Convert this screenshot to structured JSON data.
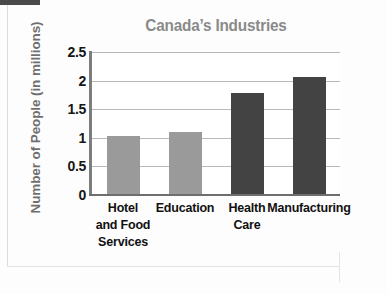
{
  "chart_data": {
    "type": "bar",
    "title": "Canada’s Industries",
    "xlabel": "",
    "ylabel": "Number of People (in millions)",
    "categories": [
      "Hotel and Food Services",
      "Education",
      "Health Care",
      "Manufacturing"
    ],
    "values": [
      1.03,
      1.1,
      1.78,
      2.07
    ],
    "ylim": [
      0,
      2.5
    ],
    "yticks": [
      "2.5",
      "2",
      "1.5",
      "1",
      "0.5",
      "0"
    ],
    "ytick_values": [
      2.5,
      2,
      1.5,
      1,
      0.5,
      0
    ],
    "grid": true,
    "legend": false,
    "bar_colors": [
      "#9a9a9a",
      "#9a9a9a",
      "#434343",
      "#434343"
    ],
    "series": [
      {
        "name": "Number of People (in millions)",
        "values": [
          1.03,
          1.1,
          1.78,
          2.07
        ]
      }
    ]
  },
  "chart": {
    "title": "Canada’s Industries",
    "y_axis_title": "Number of People (in millions)",
    "y_ticks": [
      {
        "label": "2.5",
        "value": 2.5
      },
      {
        "label": "2",
        "value": 2
      },
      {
        "label": "1.5",
        "value": 1.5
      },
      {
        "label": "1",
        "value": 1
      },
      {
        "label": "0.5",
        "value": 0.5
      },
      {
        "label": "0",
        "value": 0
      }
    ],
    "bars": [
      {
        "label_lines": [
          "Hotel",
          "and Food",
          "Services"
        ],
        "label": "Hotel and Food Services",
        "value": 1.03,
        "color": "#9a9a9a"
      },
      {
        "label_lines": [
          "Education"
        ],
        "label": "Education",
        "value": 1.1,
        "color": "#9a9a9a"
      },
      {
        "label_lines": [
          "Health",
          "Care"
        ],
        "label": "Health Care",
        "value": 1.78,
        "color": "#434343"
      },
      {
        "label_lines": [
          "Manufacturing"
        ],
        "label": "Manufacturing",
        "value": 2.07,
        "color": "#434343"
      }
    ],
    "colors": {
      "title": "#8a8a8a",
      "axis_title": "#6f6f6f",
      "gridline": "#b9b9b9",
      "axis_line": "#7d7d7d",
      "tick_text": "#161616",
      "plot_background": "#ffffff"
    }
  }
}
